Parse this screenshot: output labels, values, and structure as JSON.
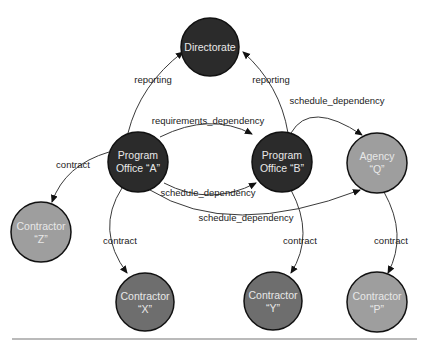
{
  "diagram": {
    "colors": {
      "dark": "#2b2b2b",
      "medium": "#6e6e6e",
      "light": "#9e9e9e",
      "edge": "#3a3a3a",
      "background": "#ffffff"
    },
    "nodes": [
      {
        "id": "directorate",
        "line1": "Directorate",
        "line2": "",
        "shade": "dark"
      },
      {
        "id": "po_a",
        "line1": "Program",
        "line2": "Office “A”",
        "shade": "dark"
      },
      {
        "id": "po_b",
        "line1": "Program",
        "line2": "Office “B”",
        "shade": "dark"
      },
      {
        "id": "agency_q",
        "line1": "Agency",
        "line2": "“Q”",
        "shade": "light"
      },
      {
        "id": "contractor_z",
        "line1": "Contractor",
        "line2": "“Z”",
        "shade": "light"
      },
      {
        "id": "contractor_x",
        "line1": "Contractor",
        "line2": "“X”",
        "shade": "medium"
      },
      {
        "id": "contractor_y",
        "line1": "Contractor",
        "line2": "“Y”",
        "shade": "medium"
      },
      {
        "id": "contractor_p",
        "line1": "Contractor",
        "line2": "“P”",
        "shade": "light"
      }
    ],
    "edges": [
      {
        "from": "po_a",
        "to": "directorate",
        "label": "reporting"
      },
      {
        "from": "po_b",
        "to": "directorate",
        "label": "reporting"
      },
      {
        "from": "po_a",
        "to": "po_b",
        "label": "requirements_dependency"
      },
      {
        "from": "po_a",
        "to": "po_b",
        "label": "schedule_dependency"
      },
      {
        "from": "po_b",
        "to": "agency_q",
        "label": "schedule_dependency"
      },
      {
        "from": "po_a",
        "to": "agency_q",
        "label": "schedule_dependency"
      },
      {
        "from": "po_a",
        "to": "contractor_z",
        "label": "contract"
      },
      {
        "from": "po_a",
        "to": "contractor_x",
        "label": "contract"
      },
      {
        "from": "po_b",
        "to": "contractor_y",
        "label": "contract"
      },
      {
        "from": "agency_q",
        "to": "contractor_p",
        "label": "contract"
      }
    ]
  }
}
